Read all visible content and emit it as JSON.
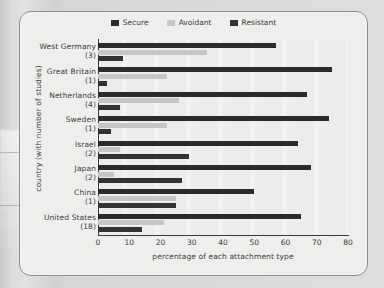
{
  "chart_data": {
    "type": "bar",
    "orientation": "horizontal",
    "title": "",
    "xlabel": "percentage of each attachment type",
    "ylabel": "country (with number of studies)",
    "xlim": [
      0,
      80
    ],
    "xticks": [
      0,
      10,
      20,
      30,
      40,
      50,
      60,
      70,
      80
    ],
    "grid": false,
    "legend_position": "top-center",
    "categories": [
      "West Germany",
      "Great Britain",
      "Netherlands",
      "Sweden",
      "Israel",
      "Japan",
      "China",
      "United States"
    ],
    "category_counts": [
      "(3)",
      "(1)",
      "(4)",
      "(1)",
      "(2)",
      "(2)",
      "(1)",
      "(18)"
    ],
    "series": [
      {
        "name": "Secure",
        "color": "#2b2b2b",
        "values": [
          57,
          75,
          67,
          74,
          64,
          68,
          50,
          65
        ]
      },
      {
        "name": "Avoidant",
        "color": "#c6c6c4",
        "values": [
          35,
          22,
          26,
          22,
          7,
          5,
          25,
          21
        ]
      },
      {
        "name": "Resistant",
        "color": "#333333",
        "values": [
          8,
          3,
          7,
          4,
          29,
          27,
          25,
          14
        ]
      }
    ]
  },
  "legend": {
    "items": [
      {
        "label": "Secure",
        "swatch": "secure"
      },
      {
        "label": "Avoidant",
        "swatch": "avoidant"
      },
      {
        "label": "Resistant",
        "swatch": "resistant"
      }
    ]
  }
}
